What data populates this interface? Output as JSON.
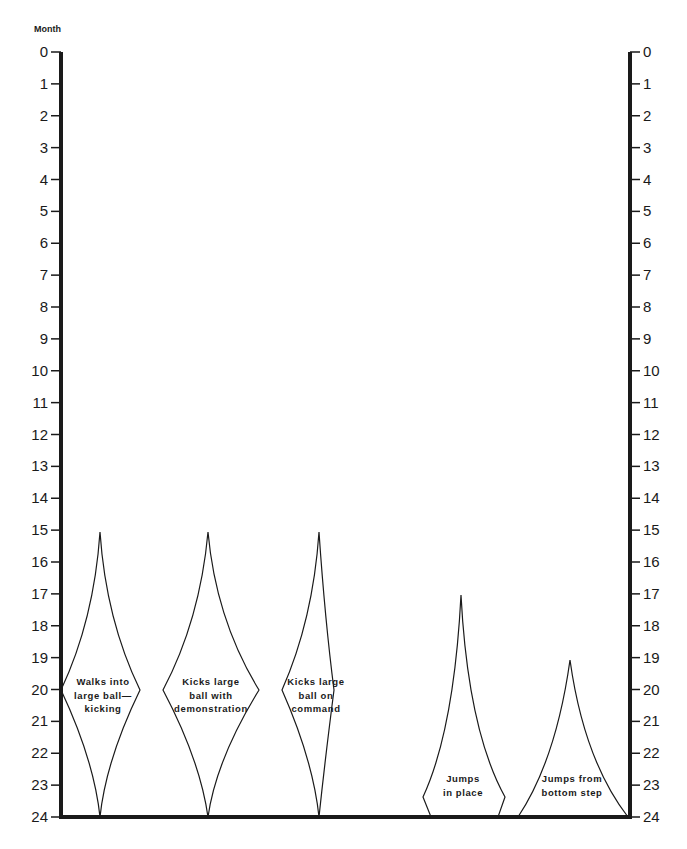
{
  "chart_data": {
    "type": "diamond-range",
    "title": "",
    "ylabel": "Month",
    "y_axis": {
      "min": 0,
      "max": 24,
      "inverted": true,
      "ticks": [
        0,
        1,
        2,
        3,
        4,
        5,
        6,
        7,
        8,
        9,
        10,
        11,
        12,
        13,
        14,
        15,
        16,
        17,
        18,
        19,
        20,
        21,
        22,
        23,
        24
      ],
      "both_sides": true
    },
    "grid": false,
    "series": [
      {
        "name": "Walks into large ball-kicking",
        "label_lines": [
          "Walks into",
          "large ball—",
          "kicking"
        ],
        "start_month": 15,
        "peak_month": 20,
        "end_month": 24
      },
      {
        "name": "Kicks large ball with demonstration",
        "label_lines": [
          "Kicks large",
          "ball with",
          "demonstration"
        ],
        "start_month": 15,
        "peak_month": 20,
        "end_month": 24
      },
      {
        "name": "Kicks large ball on command",
        "label_lines": [
          "Kicks large",
          "ball on",
          "command"
        ],
        "start_month": 15,
        "peak_month": 20,
        "end_month": 24
      },
      {
        "name": "Jumps in place",
        "label_lines": [
          "Jumps",
          "in place"
        ],
        "start_month": 17,
        "peak_month": 23.5,
        "end_month": 24
      },
      {
        "name": "Jumps from bottom step",
        "label_lines": [
          "Jumps from",
          "bottom step"
        ],
        "start_month": 19,
        "peak_month": 24,
        "end_month": 24
      }
    ]
  },
  "axis": {
    "month_label": "Month",
    "ticks": [
      "0",
      "1",
      "2",
      "3",
      "4",
      "5",
      "6",
      "7",
      "8",
      "9",
      "10",
      "11",
      "12",
      "13",
      "14",
      "15",
      "16",
      "17",
      "18",
      "19",
      "20",
      "21",
      "22",
      "23",
      "24"
    ]
  },
  "shapes": [
    {
      "label_lines": [
        "Walks into",
        "large ball—",
        "kicking"
      ]
    },
    {
      "label_lines": [
        "Kicks large",
        "ball with",
        "demonstration"
      ]
    },
    {
      "label_lines": [
        "Kicks large",
        "ball  on",
        "command"
      ]
    },
    {
      "label_lines": [
        "Jumps",
        "in place"
      ]
    },
    {
      "label_lines": [
        "Jumps from",
        "bottom step"
      ]
    }
  ]
}
